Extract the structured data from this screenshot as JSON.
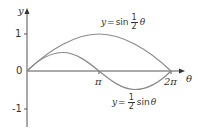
{
  "diagram": {
    "axes": {
      "x_label": "θ",
      "y_label": "y",
      "x_ticks": [
        {
          "value": "π",
          "label": "π"
        },
        {
          "value": "2π",
          "label": "2π"
        }
      ],
      "y_ticks": [
        {
          "value": 1,
          "label": "1"
        },
        {
          "value": 0,
          "label": "0"
        },
        {
          "value": -1,
          "label": "-1"
        }
      ]
    },
    "curves": [
      {
        "name": "sin-half-theta",
        "equation": {
          "lhs": "y",
          "eq": "=",
          "func": "sin",
          "num": "1",
          "den": "2",
          "var": "θ"
        },
        "description": "y = sin(θ/2)",
        "color": "#8a8a8a"
      },
      {
        "name": "half-sin-theta",
        "equation": {
          "lhs": "y",
          "eq": "=",
          "num": "1",
          "den": "2",
          "func": "sin",
          "var": "θ"
        },
        "description": "y = (1/2) sin θ",
        "color": "#8a8a8a"
      }
    ],
    "axis_color": "#555555"
  }
}
